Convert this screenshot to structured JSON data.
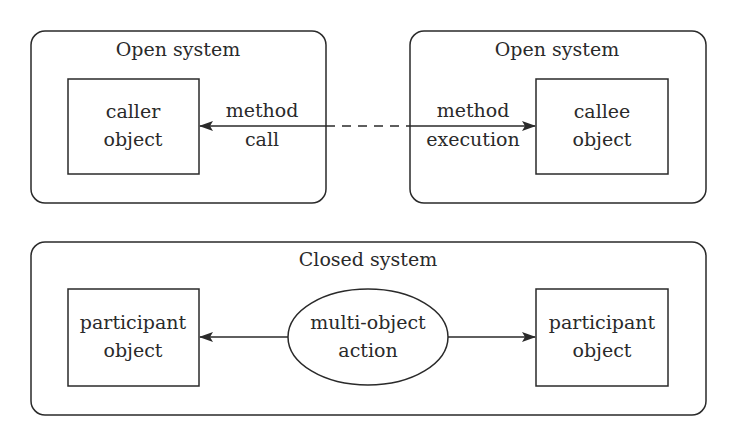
{
  "diagram": {
    "top_left": {
      "title": "Open system",
      "object": {
        "line1": "caller",
        "line2": "object"
      }
    },
    "top_right": {
      "title": "Open system",
      "object": {
        "line1": "callee",
        "line2": "object"
      }
    },
    "call_edge": {
      "left_label": {
        "line1": "method",
        "line2": "call"
      },
      "right_label": {
        "line1": "method",
        "line2": "execution"
      }
    },
    "bottom": {
      "title": "Closed system",
      "left_object": {
        "line1": "participant",
        "line2": "object"
      },
      "action": {
        "line1": "multi-object",
        "line2": "action"
      },
      "right_object": {
        "line1": "participant",
        "line2": "object"
      }
    },
    "colors": {
      "stroke": "#2a2a2a",
      "background": "#ffffff"
    }
  }
}
